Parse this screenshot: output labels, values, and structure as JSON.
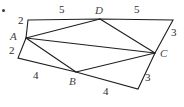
{
  "figure": {
    "stroke_color": "#1f1f1f",
    "label_color": "#2b2b2b",
    "background_color": "#ffffff",
    "width": 184,
    "height": 107,
    "bullet": {
      "name": "list-bullet",
      "x": 2,
      "y": 9
    },
    "vertices": [
      {
        "id": "TL",
        "label": "",
        "x": 28,
        "y": 20
      },
      {
        "id": "D",
        "label": "D",
        "x": 100,
        "y": 19
      },
      {
        "id": "TR",
        "label": "",
        "x": 173,
        "y": 20
      },
      {
        "id": "C",
        "label": "C",
        "x": 155,
        "y": 53
      },
      {
        "id": "BR",
        "label": "",
        "x": 138,
        "y": 89
      },
      {
        "id": "B",
        "label": "B",
        "x": 76,
        "y": 72
      },
      {
        "id": "BL",
        "label": "",
        "x": 18,
        "y": 58
      },
      {
        "id": "A",
        "label": "A",
        "x": 26,
        "y": 38
      }
    ],
    "outline_path": "M 28 20 L 100 19 L 173 20 L 155 53 L 138 89 L 76 72 L 18 58 L 26 38 Z",
    "diagonals": [
      {
        "id": "A-D",
        "path": "M 26 38 L 100 19"
      },
      {
        "id": "A-B",
        "path": "M 26 38 L 76 72"
      },
      {
        "id": "A-C",
        "path": "M 26 38 L 155 53"
      },
      {
        "id": "D-C",
        "path": "M 100 19 L 155 53"
      },
      {
        "id": "B-C",
        "path": "M 76 72 L 155 53"
      }
    ],
    "vertex_labels": [
      {
        "name": "vertex-label-a",
        "text": "A",
        "x": 10,
        "y": 31
      },
      {
        "name": "vertex-label-d",
        "text": "D",
        "x": 95,
        "y": 5
      },
      {
        "name": "vertex-label-c",
        "text": "C",
        "x": 160,
        "y": 48
      },
      {
        "name": "vertex-label-b",
        "text": "B",
        "x": 69,
        "y": 76
      }
    ],
    "side_labels": [
      {
        "name": "length-label-top-left",
        "text": "5",
        "x": 59,
        "y": 4
      },
      {
        "name": "length-label-top-right",
        "text": "5",
        "x": 134,
        "y": 4
      },
      {
        "name": "length-label-right-upper",
        "text": "3",
        "x": 171,
        "y": 27
      },
      {
        "name": "length-label-right-lower",
        "text": "3",
        "x": 145,
        "y": 72
      },
      {
        "name": "length-label-bottom",
        "text": "4",
        "x": 103,
        "y": 86
      },
      {
        "name": "length-label-bottom-left",
        "text": "4",
        "x": 33,
        "y": 70
      },
      {
        "name": "length-label-left-upper",
        "text": "2",
        "x": 18,
        "y": 15
      },
      {
        "name": "length-label-left-lower",
        "text": "2",
        "x": 9,
        "y": 45
      }
    ]
  }
}
